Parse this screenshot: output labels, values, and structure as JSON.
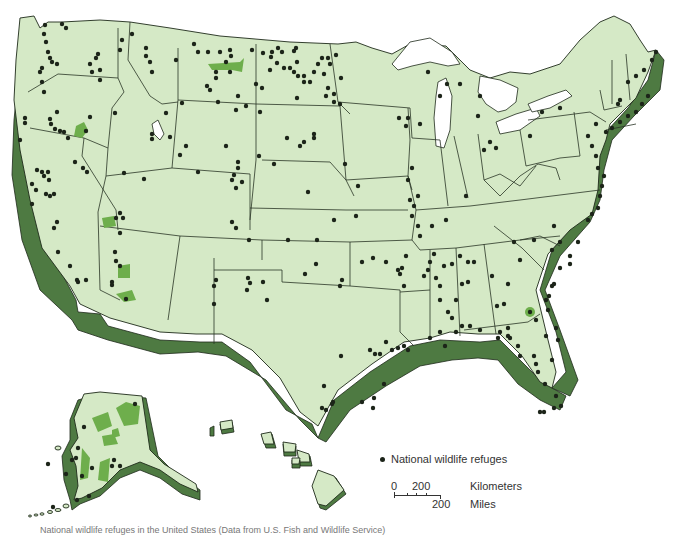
{
  "map": {
    "title": "National wildlife refuges of the United States",
    "colors": {
      "land": "#d5e9c6",
      "extrusion": "#4e7a42",
      "refuge_area": "#6eae4c",
      "refuge_dot": "#1c2419",
      "water": "#ffffff",
      "border": "#1e2a1a"
    },
    "regions": [
      "Contiguous United States",
      "Alaska",
      "Hawaii"
    ]
  },
  "legend": {
    "items": [
      {
        "icon": "dot-icon",
        "label": "National wildlife refuges"
      }
    ]
  },
  "scale_bar": {
    "km_zero": "0",
    "km_value": "200",
    "km_unit": "Kilometers",
    "mi_value": "200",
    "mi_unit": "Miles"
  },
  "caption": {
    "text": "National wildlife refuges in the United States (Data from U.S. Fish and Wildlife Service)"
  }
}
